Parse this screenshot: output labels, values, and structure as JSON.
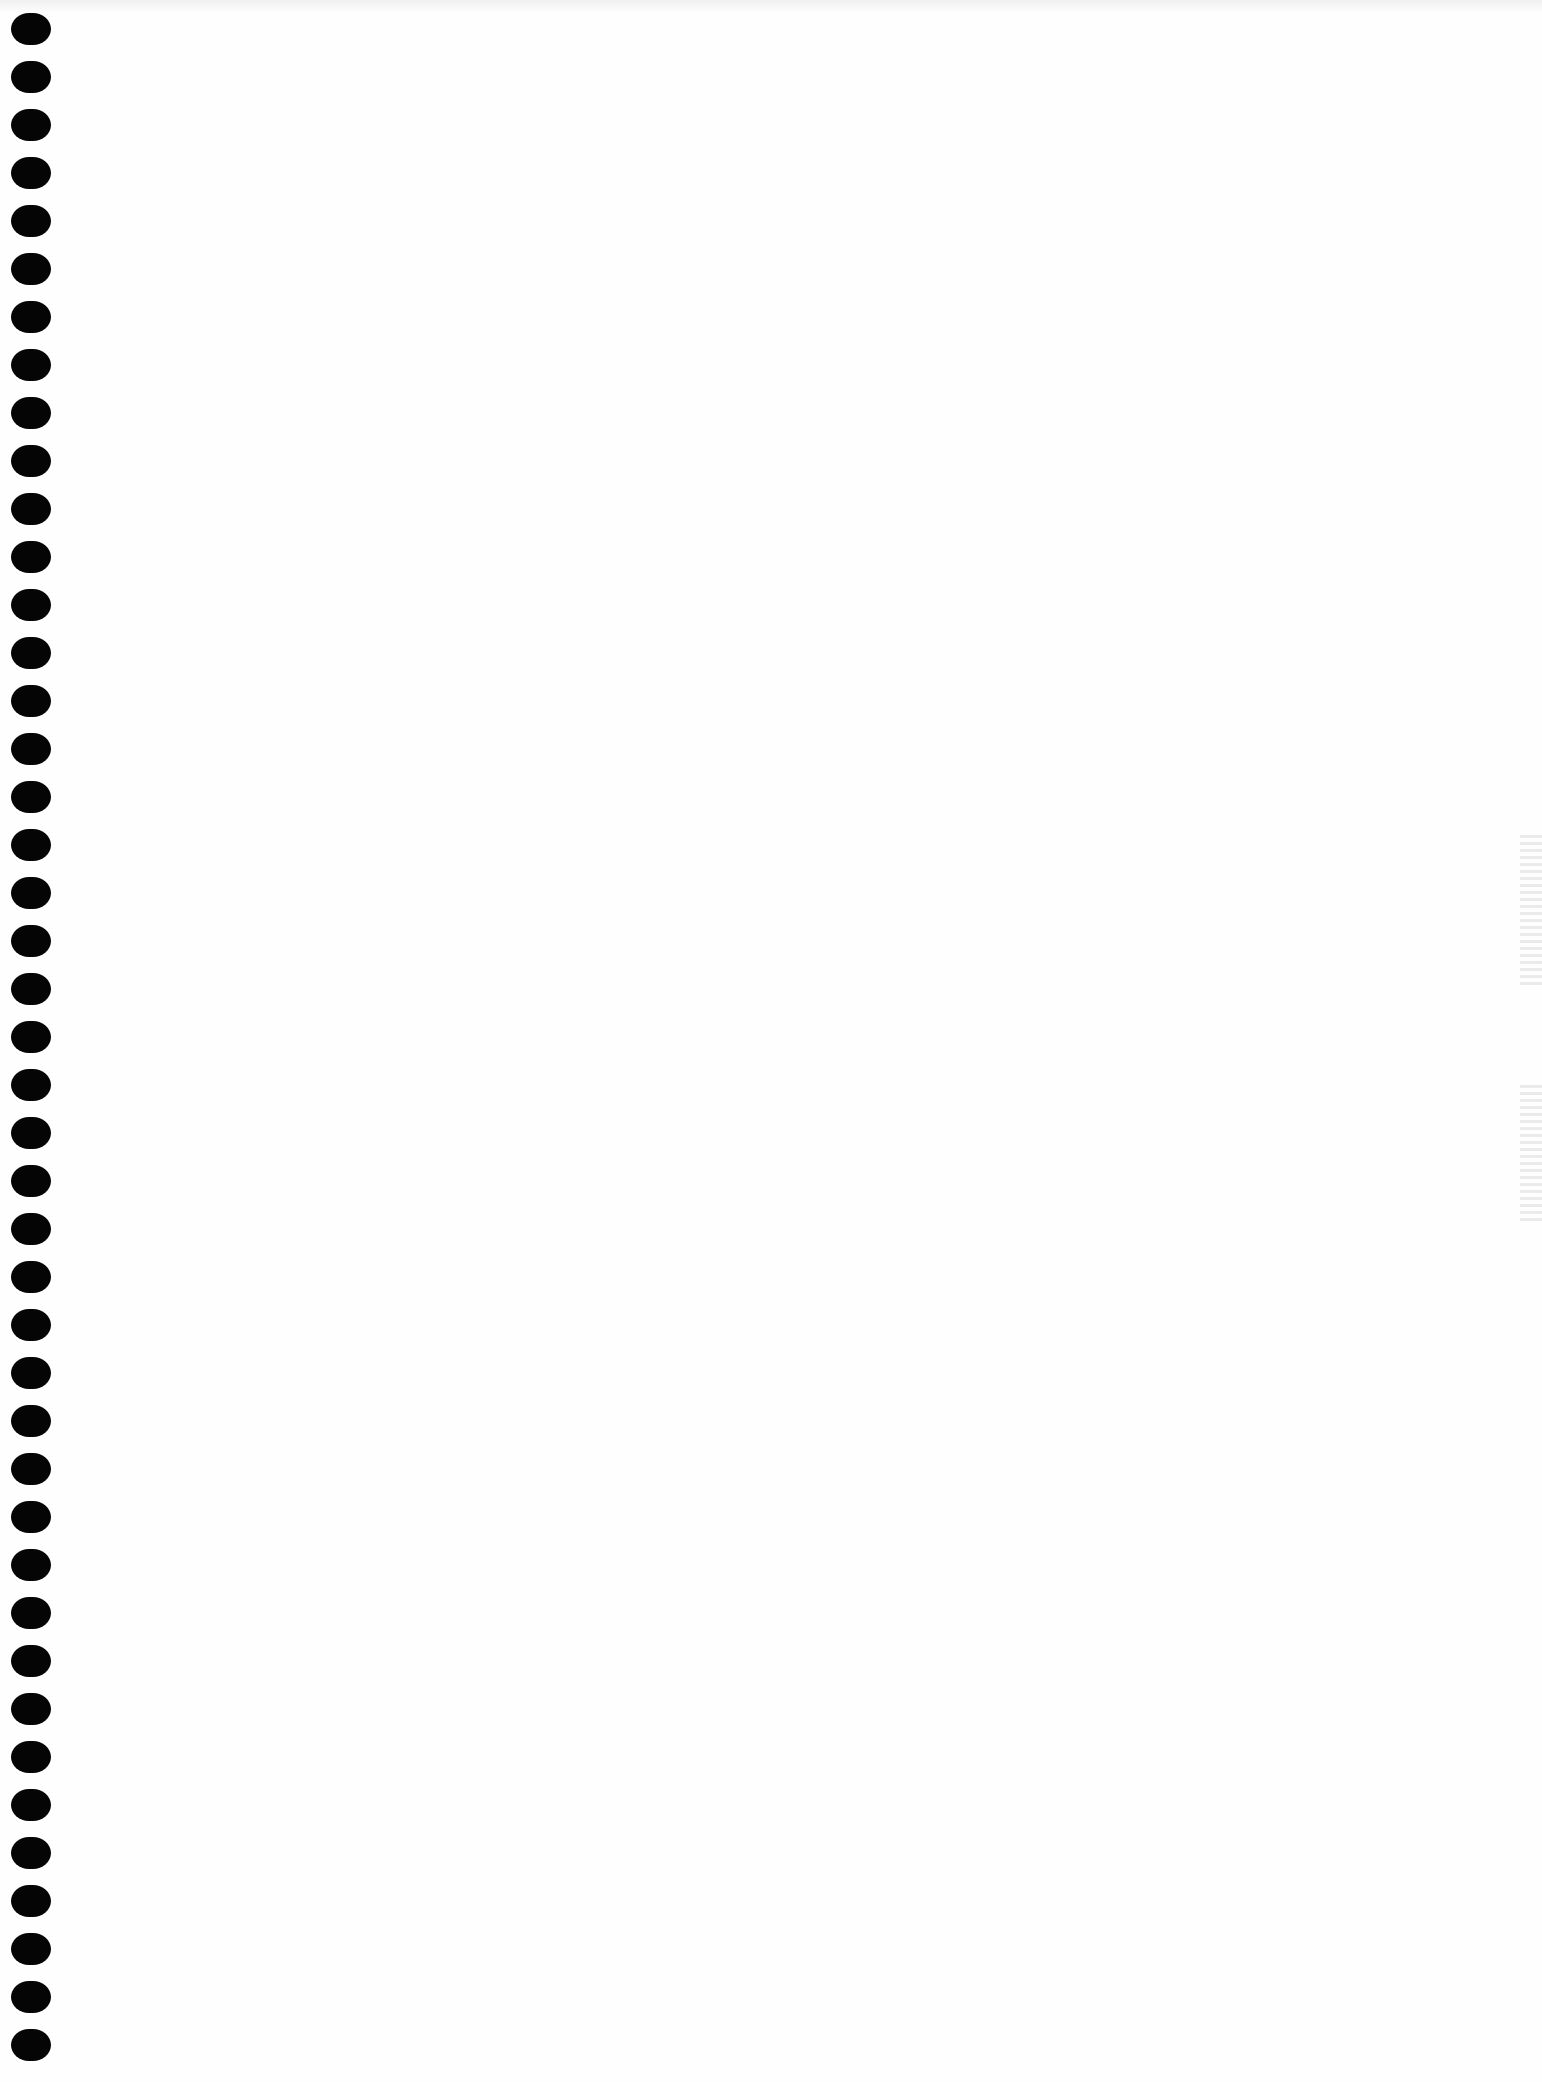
{
  "page": {
    "background_color": "#fefefe",
    "binding": {
      "hole_count": 43,
      "hole_color": "#050505",
      "first_hole_top": 13,
      "hole_spacing": 48
    }
  }
}
